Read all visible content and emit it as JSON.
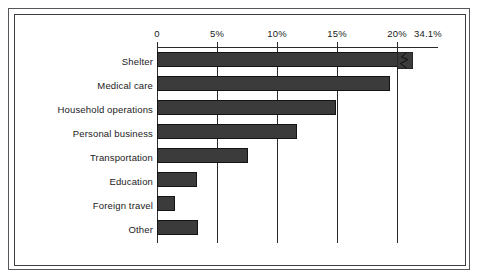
{
  "figure": {
    "background_color": "#ffffff",
    "frame_color": "#3c3d40",
    "bar_color": "#3b3b3b",
    "bar_outline_color": "#141414",
    "axis_color": "#2b2b2b"
  },
  "chart_data": {
    "type": "bar",
    "orientation": "horizontal",
    "title": "",
    "subtitle": "",
    "xlabel": "",
    "ylabel": "",
    "categories": [
      "Shelter",
      "Medical care",
      "Household operations",
      "Personal business",
      "Transportation",
      "Education",
      "Foreign travel",
      "Other"
    ],
    "values": [
      34.1,
      19.4,
      14.9,
      11.7,
      7.6,
      3.3,
      1.5,
      3.4
    ],
    "value_labels": [
      "34.1%",
      "",
      "",
      "",
      "",
      "",
      "",
      ""
    ],
    "xlim": [
      0,
      20
    ],
    "xticks": [
      0,
      5,
      10,
      15,
      20
    ],
    "xticklabels": [
      "0",
      "5%",
      "10%",
      "15%",
      "20%"
    ],
    "extra_axis_label": "34.1%",
    "axis_break": {
      "series": "Shelter",
      "symbol": "zigzag",
      "note": "Shelter bar is truncated with a break symbol; its true value is 34.1%"
    },
    "grid": true,
    "grid_axis": "x",
    "legend": false,
    "legend_position": "none",
    "bar_count": 8
  }
}
